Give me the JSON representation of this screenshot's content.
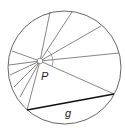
{
  "diagram": {
    "title": "",
    "circle": {
      "cx": 64.5,
      "cy": 67.5,
      "r": 56.5
    },
    "point_P": {
      "x": 40,
      "y": 61,
      "label": "P"
    },
    "chord_g": {
      "x1": 27,
      "y1": 110,
      "x2": 114,
      "y2": 94,
      "label": "g"
    },
    "rays": [
      {
        "x": 50,
        "y": 12
      },
      {
        "x": 72,
        "y": 12
      },
      {
        "x": 101,
        "y": 26
      },
      {
        "x": 119,
        "y": 53
      },
      {
        "x": 114,
        "y": 94
      },
      {
        "x": 27,
        "y": 110
      },
      {
        "x": 20,
        "y": 97
      },
      {
        "x": 14,
        "y": 87
      },
      {
        "x": 10,
        "y": 75
      },
      {
        "x": 9,
        "y": 65
      },
      {
        "x": 12,
        "y": 51
      }
    ],
    "angle_arc": {
      "r": 13
    },
    "colors": {
      "stroke": "#666666",
      "chord": "#111111"
    }
  }
}
